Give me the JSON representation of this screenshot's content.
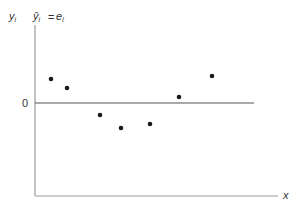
{
  "chart_data": {
    "type": "scatter",
    "title": "",
    "xlabel": "x",
    "ylabel": "y_i  ŷ_i = e_i",
    "ylabel_parts": {
      "y": "y",
      "sub_i": "i",
      "yhat": "ŷ",
      "eq": "=",
      "e": "e"
    },
    "y_ticks": [
      "0"
    ],
    "reference_line": {
      "y": 0,
      "label": "0"
    },
    "grid": false,
    "legend": null,
    "points": [
      {
        "x": 1,
        "y": 0.9
      },
      {
        "x": 2,
        "y": 0.55
      },
      {
        "x": 3,
        "y": -0.45
      },
      {
        "x": 4,
        "y": -0.95
      },
      {
        "x": 5,
        "y": -0.8
      },
      {
        "x": 6,
        "y": 0.25
      },
      {
        "x": 7,
        "y": 1.05
      }
    ],
    "pixel_points": [
      [
        51,
        79
      ],
      [
        67,
        88
      ],
      [
        100,
        115
      ],
      [
        121,
        128
      ],
      [
        150,
        124
      ],
      [
        179,
        97
      ],
      [
        212,
        76
      ]
    ]
  },
  "labels": {
    "zero": "0",
    "x": "x",
    "y": "y",
    "i": "i",
    "yhat": "ŷ",
    "eq": "=",
    "e": "e"
  },
  "colors": {
    "axis": "#9a9a9a",
    "points": "#1a1a1a",
    "text": "#333333"
  }
}
